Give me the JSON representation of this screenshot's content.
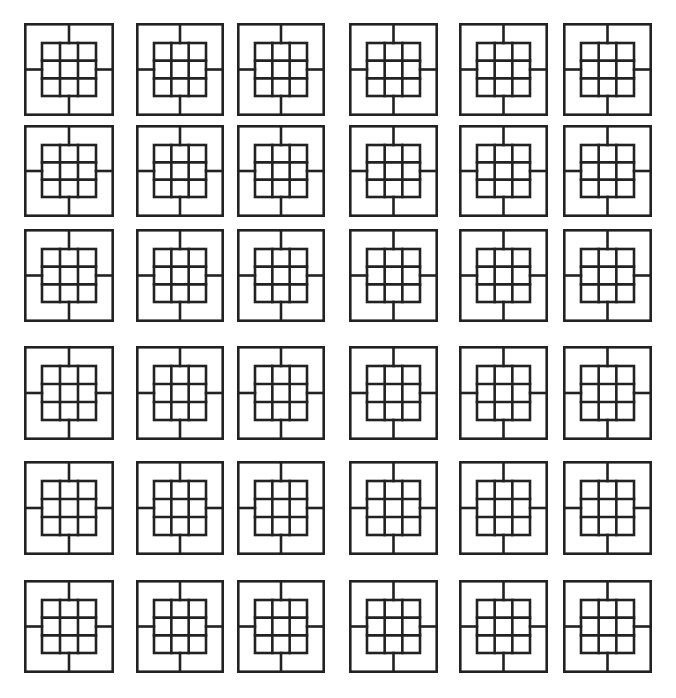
{
  "diagram": {
    "title": "",
    "stroke_color": "#222222",
    "background_color": "#ffffff",
    "stroke_width": 2.6,
    "rows": 6,
    "cols": 6,
    "column_bounds": [
      [
        24,
        114
      ],
      [
        136,
        224
      ],
      [
        237,
        325
      ],
      [
        349,
        438
      ],
      [
        459,
        548
      ],
      [
        563,
        652
      ]
    ],
    "row_bounds": [
      [
        23,
        116
      ],
      [
        125,
        217
      ],
      [
        229,
        322
      ],
      [
        346,
        440
      ],
      [
        461,
        555
      ],
      [
        580,
        673
      ]
    ],
    "tile_pattern": {
      "outer_frame": "square",
      "inner_grid": "3x3",
      "inner_inset_x_ratio": 0.2,
      "inner_inset_y_ratio": 0.215,
      "spokes": [
        "top",
        "bottom",
        "left",
        "right"
      ]
    }
  }
}
